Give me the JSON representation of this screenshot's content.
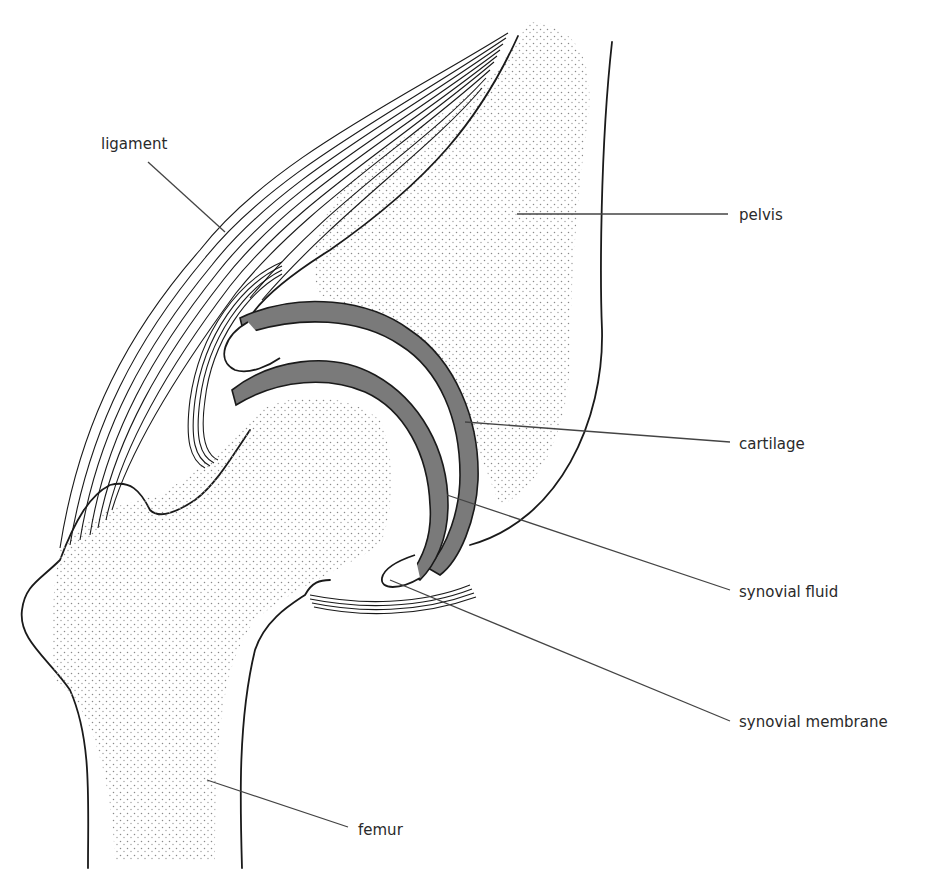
{
  "diagram": {
    "colors": {
      "outline": "#1a1a1a",
      "cartilage": "#7a7a7a",
      "bone_stipple": "#8a8a8a",
      "background": "#ffffff",
      "label_text": "#2a2a2a"
    },
    "labels": {
      "ligament": "ligament",
      "pelvis": "pelvis",
      "cartilage": "cartilage",
      "synovial_fluid": "synovial fluid",
      "synovial_membrane": "synovial membrane",
      "femur": "femur"
    }
  }
}
